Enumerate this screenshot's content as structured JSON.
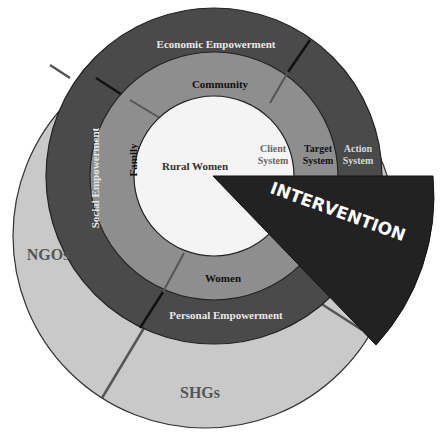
{
  "diagram": {
    "center": {
      "label": "Rural Women"
    },
    "outer_base": {
      "labels": [
        "NGOs",
        "SHGs"
      ]
    },
    "middle_ring": {
      "segments": [
        "Community",
        "Family",
        "Women"
      ],
      "right_label": "Client System"
    },
    "outer_ring": {
      "segments": [
        "Economic Empowerment",
        "Social Empowerment",
        "Personal Empowerment"
      ],
      "target_label": "Target System",
      "action_label": "Action System"
    },
    "wedge": {
      "label": "INTERVENTION"
    },
    "labels": {
      "client_line1": "Client",
      "client_line2": "System",
      "target_line1": "Target",
      "target_line2": "System",
      "action_line1": "Action",
      "action_line2": "System"
    },
    "colors": {
      "outer_base": "#c9c9c9",
      "outer_ring": "#4a4a4a",
      "middle_ring": "#8e8e8e",
      "center": "#f4f4f4",
      "wedge": "#222222",
      "divider_dark": "#111111",
      "divider_grey": "#555555"
    }
  }
}
